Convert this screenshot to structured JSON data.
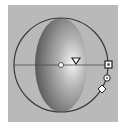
{
  "widget": {
    "type": "light-direction-gizmo",
    "colors": {
      "panel": "#b9b9b9",
      "ring": "#3a3a3a",
      "sphere_dark": "#5a5a5a",
      "sphere_light": "#f2f2f2",
      "handle_fill": "#ffffff",
      "handle_stroke": "#333333"
    },
    "handles": [
      {
        "name": "center-handle",
        "shape": "circle"
      },
      {
        "name": "direction-handle",
        "shape": "triangle"
      },
      {
        "name": "rotation-handle",
        "shape": "square"
      },
      {
        "name": "tilt-handle",
        "shape": "circle"
      },
      {
        "name": "intensity-handle",
        "shape": "diamond"
      }
    ]
  }
}
